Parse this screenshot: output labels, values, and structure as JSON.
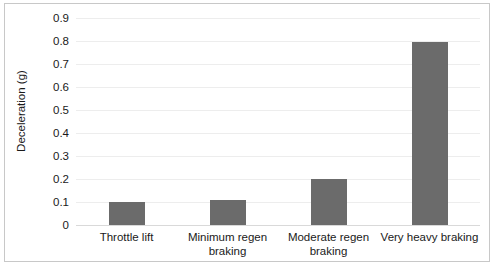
{
  "chart_data": {
    "type": "bar",
    "title": "",
    "xlabel": "",
    "ylabel": "Deceleration (g)",
    "categories": [
      "Throttle lift",
      "Minimum regen braking",
      "Moderate regen braking",
      "Very heavy braking"
    ],
    "values": [
      0.1,
      0.11,
      0.2,
      0.795
    ],
    "ylim": [
      0,
      0.9
    ],
    "ytick_labels": [
      "0",
      "0.1",
      "0.2",
      "0.3",
      "0.4",
      "0.5",
      "0.6",
      "0.7",
      "0.8",
      "0.9"
    ],
    "ytick_values": [
      0,
      0.1,
      0.2,
      0.3,
      0.4,
      0.5,
      0.6,
      0.7,
      0.8,
      0.9
    ],
    "grid": true,
    "legend": false,
    "legend_position": "none",
    "bar_color": "#6b6b6b",
    "gridline_color": "#ededed",
    "axis_color": "#d9d9d9",
    "background_color": "#ffffff",
    "border_color": "#c8c8c8"
  }
}
